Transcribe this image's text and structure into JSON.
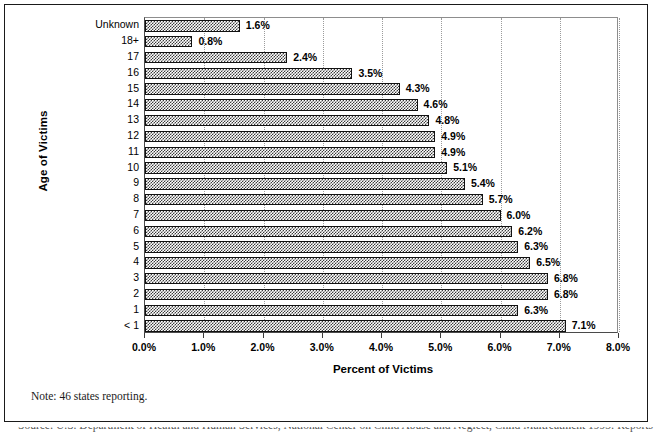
{
  "chart_data": {
    "type": "bar",
    "orientation": "horizontal",
    "title": "",
    "xlabel": "Percent of Victims",
    "ylabel": "Age of Victims",
    "xlim": [
      0,
      8
    ],
    "xtick_labels": [
      "0.0%",
      "1.0%",
      "2.0%",
      "3.0%",
      "4.0%",
      "5.0%",
      "6.0%",
      "7.0%",
      "8.0%"
    ],
    "xtick_values": [
      0,
      1,
      2,
      3,
      4,
      5,
      6,
      7,
      8
    ],
    "grid": "vertical-dotted",
    "legend": "none",
    "categories": [
      "Unknown",
      "18+",
      "17",
      "16",
      "15",
      "14",
      "13",
      "12",
      "11",
      "10",
      "9",
      "8",
      "7",
      "6",
      "5",
      "4",
      "3",
      "2",
      "1",
      "< 1"
    ],
    "values": [
      1.6,
      0.8,
      2.4,
      3.5,
      4.3,
      4.6,
      4.8,
      4.9,
      4.9,
      5.1,
      5.4,
      5.7,
      6.0,
      6.2,
      6.3,
      6.5,
      6.8,
      6.8,
      6.3,
      7.1
    ],
    "data_labels": [
      "1.6%",
      "0.8%",
      "2.4%",
      "3.5%",
      "4.3%",
      "4.6%",
      "4.8%",
      "4.9%",
      "4.9%",
      "5.1%",
      "5.4%",
      "5.7%",
      "6.0%",
      "6.2%",
      "6.3%",
      "6.5%",
      "6.8%",
      "6.8%",
      "6.3%",
      "7.1%"
    ],
    "annotations": [
      "Note: 46 states reporting."
    ],
    "bar_fill": "#3b3b3b",
    "bar_pattern": "crosshatch",
    "bar_border": "#111111"
  },
  "figure": {
    "note": "Note: 46 states reporting.",
    "source_line": "Source: U.S. Department of Health and Human Services, National Center on Child Abuse and Neglect, Child Maltreatment 1993: Reports"
  }
}
